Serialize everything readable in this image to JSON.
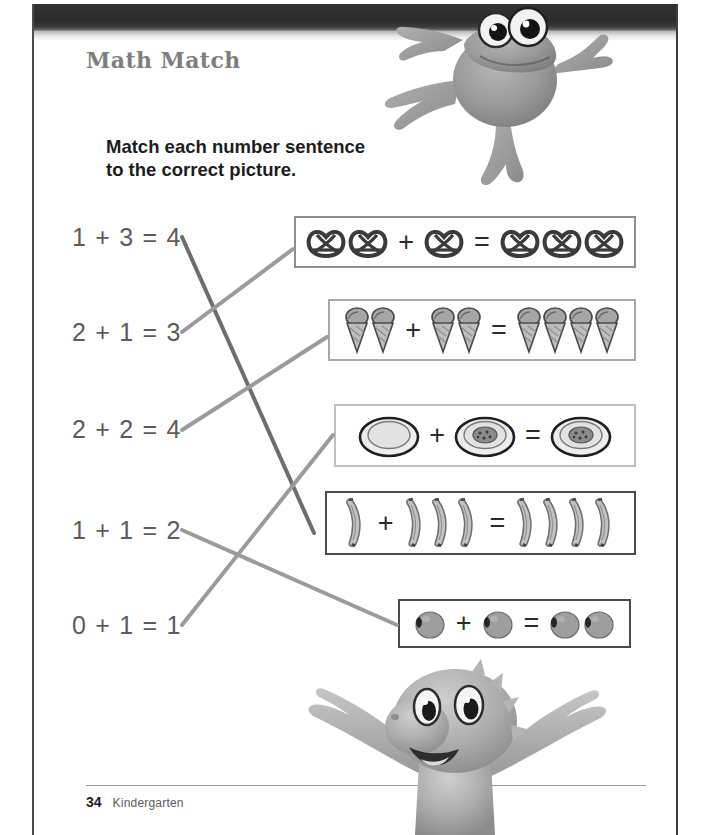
{
  "page": {
    "title": "Math Match",
    "instructions": "Match each number sentence\nto the correct picture.",
    "footer": {
      "page_number": "34",
      "grade": "Kindergarten"
    },
    "colors": {
      "header_band": "#2a2a2a",
      "title_text": "#7e7e7e",
      "equation_text": "#5c5c5c",
      "instruction_text": "#1d1d1d",
      "connector_dark": "#6e6e6e",
      "connector_light": "#9b9b9b",
      "box_border_dark": "#4a4a4a",
      "box_border_light": "#b8b8b8",
      "page_background": "#ffffff"
    }
  },
  "equations": [
    {
      "id": "eq-1",
      "text": "1 + 3 = 4",
      "x": 72,
      "y": 223
    },
    {
      "id": "eq-2",
      "text": "2 + 1 = 3",
      "x": 72,
      "y": 318
    },
    {
      "id": "eq-3",
      "text": "2 + 2 = 4",
      "x": 72,
      "y": 415
    },
    {
      "id": "eq-4",
      "text": "1 + 1 = 2",
      "x": 72,
      "y": 516
    },
    {
      "id": "eq-5",
      "text": "0 + 1 = 1",
      "x": 72,
      "y": 611
    }
  ],
  "picture_boxes": [
    {
      "id": "box-pretzels",
      "item": "pretzel",
      "addend_1": 2,
      "addend_2": 1,
      "sum": 3,
      "plus": "+",
      "equals": "=",
      "x": 294,
      "y": 216,
      "width": 342,
      "height": 52,
      "border": "#8d8d8d",
      "border_width": 2
    },
    {
      "id": "box-ice-cream-cones",
      "item": "ice-cream-cone",
      "addend_1": 2,
      "addend_2": 2,
      "sum": 4,
      "plus": "+",
      "equals": "=",
      "x": 328,
      "y": 299,
      "width": 308,
      "height": 62,
      "border": "#a8a8a8",
      "border_width": 2
    },
    {
      "id": "box-plates",
      "item": "plate",
      "addend_1": 1,
      "addend_2": 1,
      "sum": 1,
      "plus": "+",
      "equals": "=",
      "x": 334,
      "y": 404,
      "width": 302,
      "height": 63,
      "border": "#c0c0c0",
      "border_width": 2
    },
    {
      "id": "box-bananas",
      "item": "banana",
      "addend_1": 1,
      "addend_2": 3,
      "sum": 4,
      "plus": "+",
      "equals": "=",
      "x": 325,
      "y": 491,
      "width": 311,
      "height": 64,
      "border": "#4a4a4a",
      "border_width": 2
    },
    {
      "id": "box-plums",
      "item": "plum",
      "addend_1": 1,
      "addend_2": 1,
      "sum": 2,
      "plus": "+",
      "equals": "=",
      "x": 398,
      "y": 599,
      "width": 233,
      "height": 49,
      "border": "#4a4a4a",
      "border_width": 2
    }
  ],
  "connectors": [
    {
      "id": "line-eq1-to-bananas",
      "from": "eq-1",
      "to": "box-bananas",
      "x1": 182,
      "y1": 237,
      "x2": 314,
      "y2": 533,
      "color": "#6e6e6e",
      "width": 4
    },
    {
      "id": "line-eq2-to-pretzels",
      "from": "eq-2",
      "to": "box-pretzels",
      "x1": 182,
      "y1": 332,
      "x2": 293,
      "y2": 249,
      "color": "#9b9b9b",
      "width": 4
    },
    {
      "id": "line-eq3-to-cones",
      "from": "eq-3",
      "to": "box-cones",
      "x1": 182,
      "y1": 430,
      "x2": 327,
      "y2": 337,
      "color": "#9b9b9b",
      "width": 4
    },
    {
      "id": "line-eq4-to-plums",
      "from": "eq-4",
      "to": "box-plums",
      "x1": 182,
      "y1": 530,
      "x2": 397,
      "y2": 625,
      "color": "#9b9b9b",
      "width": 4
    },
    {
      "id": "line-eq5-to-plates",
      "from": "eq-5",
      "to": "box-plates",
      "x1": 182,
      "y1": 625,
      "x2": 333,
      "y2": 435,
      "color": "#9b9b9b",
      "width": 4
    }
  ],
  "mascots": [
    {
      "id": "frog",
      "name": "frog-mascot",
      "x": 360,
      "y": 2,
      "width": 290,
      "height": 190
    },
    {
      "id": "dragon",
      "name": "dragon-mascot",
      "x": 283,
      "y": 655,
      "width": 340,
      "height": 180
    }
  ]
}
